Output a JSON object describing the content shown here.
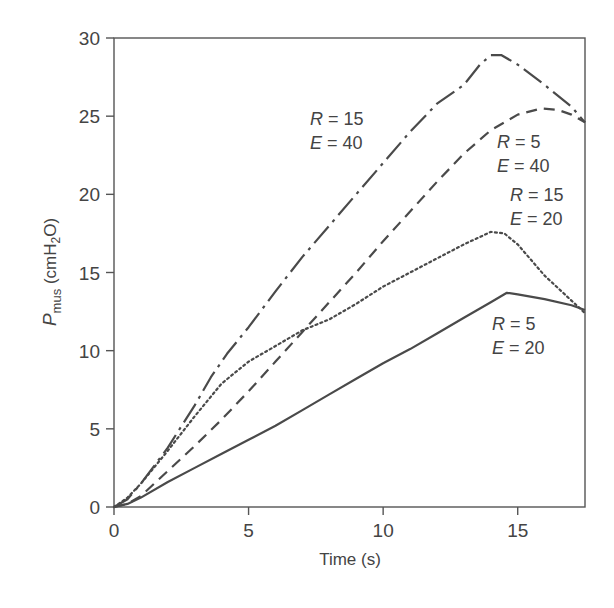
{
  "chart_data": {
    "type": "line",
    "title": "",
    "xlabel": "Time (s)",
    "ylabel": "P_mus (cmH2O)",
    "ylabel_parts": {
      "main": "P",
      "sub": "mus",
      "unit_pre": " (cmH",
      "unit_sub": "2",
      "unit_post": "O)"
    },
    "xlim": [
      0,
      17.5
    ],
    "ylim": [
      0,
      30
    ],
    "xticks": [
      0,
      5,
      10,
      15
    ],
    "yticks": [
      0,
      5,
      10,
      15,
      20,
      25,
      30
    ],
    "grid": false,
    "legend_position": "inline annotations",
    "series": [
      {
        "name": "R = 15, E = 40",
        "style": "dash-dot",
        "label": {
          "r": "R",
          "r_val": "= 15",
          "e": "E",
          "e_val": "= 40"
        },
        "x": [
          0,
          0.5,
          1,
          2,
          3,
          3.6,
          4.2,
          5,
          6,
          7,
          8,
          9,
          10,
          11,
          12,
          13,
          13.6,
          14,
          14.4,
          15,
          16,
          17,
          17.5
        ],
        "y": [
          0,
          0.5,
          1.5,
          3.8,
          6.5,
          8.3,
          9.8,
          11.5,
          13.8,
          16,
          18,
          20,
          22,
          24,
          25.8,
          27,
          28.3,
          28.9,
          28.9,
          28.3,
          27,
          25.6,
          24.6
        ]
      },
      {
        "name": "R = 5, E = 40",
        "style": "dashed",
        "label": {
          "r": "R",
          "r_val": "= 5",
          "e": "E",
          "e_val": "= 40"
        },
        "x": [
          0,
          0.5,
          1,
          2,
          3,
          4,
          5,
          6,
          7,
          8,
          9,
          10,
          11,
          12,
          13,
          14,
          15,
          15.9,
          16.5,
          17,
          17.5
        ],
        "y": [
          0,
          0.2,
          0.7,
          2.3,
          3.9,
          5.6,
          7.4,
          9.3,
          11.2,
          13.1,
          15,
          17,
          18.9,
          20.8,
          22.6,
          24.1,
          25.1,
          25.5,
          25.4,
          25.1,
          24.6
        ]
      },
      {
        "name": "R = 15, E = 20",
        "style": "dotted",
        "label": {
          "r": "R",
          "r_val": "= 15",
          "e": "E",
          "e_val": "= 20"
        },
        "x": [
          0,
          0.5,
          1,
          2,
          3,
          4,
          5,
          6,
          7,
          8,
          9,
          10,
          11,
          12,
          13,
          14,
          14.5,
          15,
          16,
          17,
          17.5
        ],
        "y": [
          0,
          0.6,
          1.5,
          3.6,
          5.8,
          7.9,
          9.3,
          10.3,
          11.3,
          12,
          13,
          14.1,
          15,
          15.9,
          16.8,
          17.6,
          17.5,
          16.8,
          14.8,
          13.2,
          12.4
        ]
      },
      {
        "name": "R = 5, E = 20",
        "style": "solid",
        "label": {
          "r": "R",
          "r_val": "= 5",
          "e": "E",
          "e_val": "= 20"
        },
        "x": [
          0,
          0.5,
          1,
          2,
          3,
          4,
          5,
          6,
          7,
          8,
          9,
          10,
          11,
          12,
          13,
          14,
          14.6,
          15,
          16,
          17,
          17.5
        ],
        "y": [
          0,
          0.2,
          0.6,
          1.6,
          2.5,
          3.4,
          4.3,
          5.2,
          6.2,
          7.2,
          8.2,
          9.2,
          10.1,
          11.1,
          12.1,
          13.1,
          13.7,
          13.6,
          13.3,
          12.9,
          12.6
        ]
      }
    ]
  }
}
